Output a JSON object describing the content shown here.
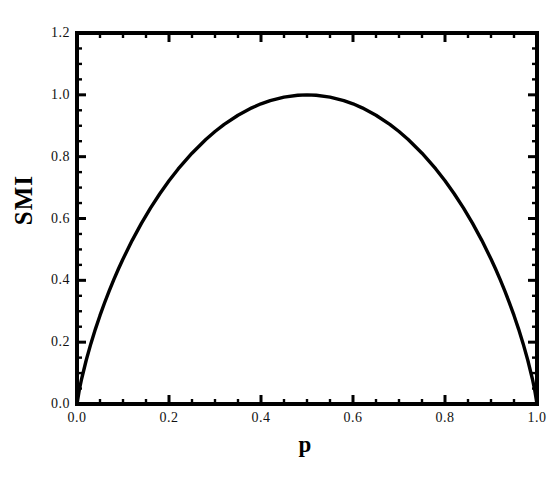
{
  "chart_data": {
    "type": "line",
    "title": "",
    "subtitle": "",
    "xlabel": "p",
    "ylabel": "SMI",
    "xlim": [
      0.0,
      1.0
    ],
    "ylim": [
      0.0,
      1.2
    ],
    "grid": false,
    "legend": null,
    "legend_position": "none",
    "annotations": [],
    "xticks": [
      0.0,
      0.2,
      0.4,
      0.6,
      0.8,
      1.0
    ],
    "xtick_labels": [
      "0.0",
      "0.2",
      "0.4",
      "0.6",
      "0.8",
      "1.0"
    ],
    "yticks": [
      0.0,
      0.2,
      0.4,
      0.6,
      0.8,
      1.0,
      1.2
    ],
    "ytick_labels": [
      "0.0",
      "0.2",
      "0.4",
      "0.6",
      "0.8",
      "1.0",
      "1.2"
    ],
    "x_minor_tick_step": 0.05,
    "y_minor_tick_step": 0.05,
    "tick_direction": "in",
    "frame": "box",
    "series": [
      {
        "name": "SMI",
        "color": "#000000",
        "line_width": 3,
        "x": [
          0.0,
          0.005,
          0.01,
          0.02,
          0.03,
          0.04,
          0.05,
          0.06,
          0.07,
          0.08,
          0.09,
          0.1,
          0.12,
          0.14,
          0.16,
          0.18,
          0.2,
          0.22,
          0.25,
          0.28,
          0.3,
          0.32,
          0.35,
          0.38,
          0.4,
          0.42,
          0.45,
          0.48,
          0.5,
          0.52,
          0.55,
          0.58,
          0.6,
          0.62,
          0.65,
          0.68,
          0.7,
          0.72,
          0.75,
          0.78,
          0.8,
          0.82,
          0.84,
          0.86,
          0.88,
          0.9,
          0.91,
          0.92,
          0.93,
          0.94,
          0.95,
          0.96,
          0.97,
          0.98,
          0.99,
          0.995,
          1.0
        ],
        "y": [
          0.0,
          0.0454,
          0.0808,
          0.1414,
          0.1944,
          0.2423,
          0.2864,
          0.3274,
          0.3659,
          0.4022,
          0.4365,
          0.469,
          0.5294,
          0.5842,
          0.6343,
          0.6801,
          0.7219,
          0.7602,
          0.8113,
          0.8555,
          0.8813,
          0.9044,
          0.9341,
          0.958,
          0.971,
          0.9815,
          0.9928,
          0.9988,
          1.0,
          0.9988,
          0.9928,
          0.9815,
          0.971,
          0.958,
          0.9341,
          0.9044,
          0.8813,
          0.8555,
          0.8113,
          0.7602,
          0.7219,
          0.6801,
          0.6343,
          0.5842,
          0.5294,
          0.469,
          0.4365,
          0.4022,
          0.3659,
          0.3274,
          0.2864,
          0.2423,
          0.1944,
          0.1414,
          0.0808,
          0.0454,
          0.0
        ]
      }
    ]
  },
  "axes": {
    "y_title": "SMI",
    "x_title": "p"
  }
}
